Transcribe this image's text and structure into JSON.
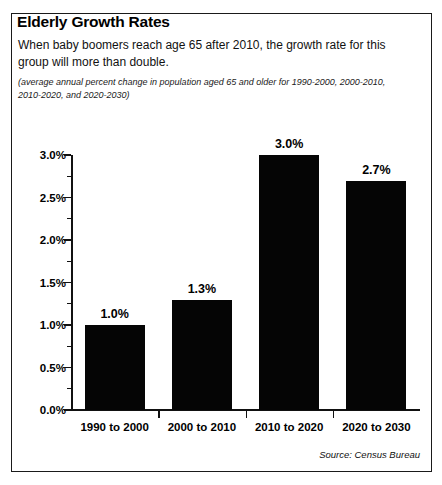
{
  "figure": {
    "headline": "Elderly Growth Rates",
    "lede": "When baby boomers reach age 65 after 2010, the growth rate for this group will more than double.",
    "subnote": "(average annual percent change in population aged 65 and older for 1990-2000, 2000-2010, 2010-2020, and 2020-2030)",
    "source": "Source: Census Bureau",
    "border_color": "#1a1a1a",
    "bar_color": "#050505",
    "background_color": "#ffffff"
  },
  "chart_data": {
    "type": "bar",
    "title": "Elderly Growth Rates",
    "subtitle": "(average annual percent change in population aged 65 and older for 1990-2000, 2000-2010, 2010-2020, and 2020-2030)",
    "categories": [
      "1990 to 2000",
      "2000 to 2010",
      "2010 to 2020",
      "2020 to 2030"
    ],
    "values": [
      1.0,
      1.3,
      3.0,
      2.7
    ],
    "data_labels": [
      "1.0%",
      "1.3%",
      "3.0%",
      "2.7%"
    ],
    "xlabel": "",
    "ylabel": "",
    "ylim": [
      0.0,
      3.0
    ],
    "ytick_values": [
      0.0,
      0.5,
      1.0,
      1.5,
      2.0,
      2.5,
      3.0
    ],
    "ytick_labels": [
      "0.0%",
      "0.5%",
      "1.0%",
      "1.5%",
      "2.0%",
      "2.5%",
      "3.0%"
    ],
    "yminor_values": [
      0.25,
      0.75,
      1.25,
      1.75,
      2.25,
      2.75
    ],
    "grid": false,
    "legend": "none",
    "series_color": "#050505",
    "source": "Source: Census Bureau"
  }
}
